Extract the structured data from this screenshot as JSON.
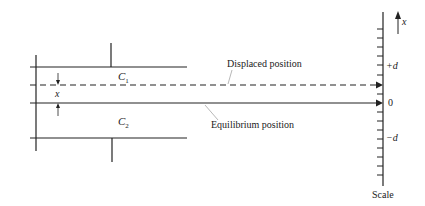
{
  "diagram": {
    "labels": {
      "c1": "C",
      "c1_sub": "1",
      "c2": "C",
      "c2_sub": "2",
      "gap": "x",
      "displaced": "Displaced position",
      "equilibrium": "Equilibrium position",
      "scale_axis": "x",
      "plus_d": "+d",
      "zero": "0",
      "minus_d": "−d",
      "scale": "Scale"
    },
    "colors": {
      "line": "#222222",
      "background": "#ffffff"
    }
  }
}
